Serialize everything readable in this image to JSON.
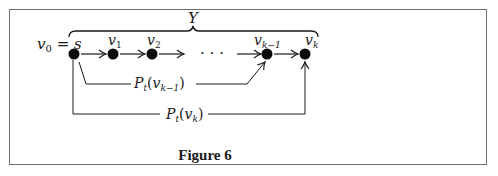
{
  "figure": {
    "caption": "Figure 6",
    "brace_label": "Y",
    "start_label": {
      "lhs": "v",
      "lhs_sub": "0",
      "eq": " = ",
      "rhs": "s"
    },
    "nodes": [
      {
        "id": "s",
        "label": "",
        "sub": ""
      },
      {
        "id": "v1",
        "label": "v",
        "sub": "1"
      },
      {
        "id": "v2",
        "label": "v",
        "sub": "2"
      },
      {
        "id": "vk-1",
        "label": "v",
        "sub": "k−1"
      },
      {
        "id": "vk",
        "label": "v",
        "sub": "k"
      }
    ],
    "ellipsis": "· · ·",
    "paths": [
      {
        "name": "P",
        "sub": "t",
        "arg": "v",
        "arg_sub": "k−1",
        "open": "(",
        "close": ")"
      },
      {
        "name": "P",
        "sub": "t",
        "arg": "v",
        "arg_sub": "k",
        "open": "(",
        "close": ")"
      }
    ]
  }
}
